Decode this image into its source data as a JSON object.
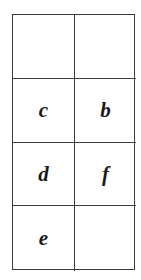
{
  "grid": {
    "rows": 4,
    "cols": 2,
    "cells": [
      [
        "",
        ""
      ],
      [
        "c",
        "b"
      ],
      [
        "d",
        "f"
      ],
      [
        "e",
        ""
      ]
    ]
  }
}
